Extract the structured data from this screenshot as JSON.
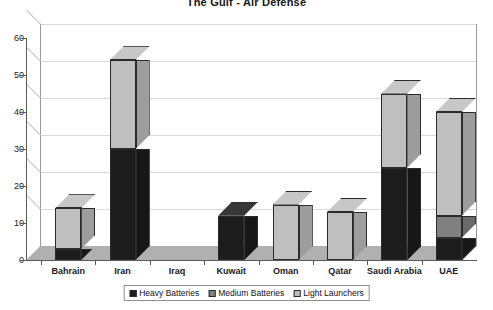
{
  "chart_data": {
    "type": "bar",
    "subtype": "stacked-column-3d",
    "title": "The Gulf - Air Defense",
    "xlabel": "",
    "ylabel": "",
    "ylim": [
      0,
      60
    ],
    "ytick_step": 10,
    "yticks": [
      "0",
      "10",
      "20",
      "30",
      "40",
      "50",
      "60"
    ],
    "grid": true,
    "legend_position": "bottom",
    "categories": [
      "Bahrain",
      "Iran",
      "Iraq",
      "Kuwait",
      "Oman",
      "Qatar",
      "Saudi Arabia",
      "UAE"
    ],
    "series": [
      {
        "name": "Heavy Batteries",
        "color": "#1c1c1c",
        "values": [
          3,
          30,
          0,
          12,
          0,
          0,
          25,
          6
        ]
      },
      {
        "name": "Medium Batteries",
        "color": "#808080",
        "values": [
          0,
          0,
          0,
          0,
          0,
          0,
          0,
          6
        ]
      },
      {
        "name": "Light Launchers",
        "color": "#bfbfbf",
        "values": [
          11,
          24,
          0,
          0,
          15,
          13,
          20,
          28
        ]
      }
    ],
    "totals": [
      14,
      54,
      0,
      12,
      15,
      13,
      45,
      40
    ]
  },
  "legend": {
    "items": [
      {
        "label": "Heavy Batteries",
        "color": "#1c1c1c"
      },
      {
        "label": "Medium Batteries",
        "color": "#808080"
      },
      {
        "label": "Light Launchers",
        "color": "#bfbfbf"
      }
    ]
  },
  "colors": {
    "plot_background": "#ffffff",
    "floor": "#b0b0b0",
    "gridline": "#d9d9d9",
    "axis": "#5a5a5a",
    "text": "#1a1a1a"
  }
}
